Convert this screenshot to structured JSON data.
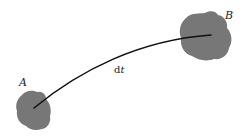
{
  "diagram": {
    "nodes": [
      {
        "id": "A",
        "label": "A",
        "color": "#767676"
      },
      {
        "id": "B",
        "label": "B",
        "color": "#767676"
      }
    ],
    "edge": {
      "from": "A",
      "to": "B",
      "label_d": "d",
      "label_t": "t",
      "color": "#111111"
    }
  }
}
